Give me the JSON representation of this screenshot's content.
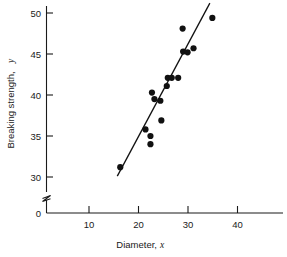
{
  "chart_data": {
    "type": "scatter",
    "title": "",
    "xlabel": "Diameter, x",
    "ylabel": "Breaking strength, y",
    "xlabel_main": "Diameter,",
    "xlabel_var": "x",
    "ylabel_main": "Breaking strength,",
    "ylabel_var": "y",
    "xlim": [
      0,
      46
    ],
    "ylim": [
      29,
      51
    ],
    "xticks": [
      10,
      20,
      30,
      40
    ],
    "xtick_labels": [
      "10",
      "20",
      "30",
      "40"
    ],
    "yticks": [
      30,
      35,
      40,
      45,
      50
    ],
    "ytick_labels": [
      "30",
      "35",
      "40",
      "45",
      "50"
    ],
    "y_origin_label": "0",
    "grid": false,
    "legend": null,
    "axis_break": {
      "axis": "y",
      "symbol": "zigzag",
      "between": [
        0,
        30
      ]
    },
    "points": [
      {
        "x": 14.9,
        "y": 31.2
      },
      {
        "x": 20.0,
        "y": 35.8
      },
      {
        "x": 21.0,
        "y": 35.0
      },
      {
        "x": 21.0,
        "y": 34.0
      },
      {
        "x": 21.3,
        "y": 40.3
      },
      {
        "x": 21.8,
        "y": 39.5
      },
      {
        "x": 23.0,
        "y": 39.3
      },
      {
        "x": 23.2,
        "y": 36.9
      },
      {
        "x": 24.3,
        "y": 41.1
      },
      {
        "x": 24.5,
        "y": 42.1
      },
      {
        "x": 25.3,
        "y": 42.1
      },
      {
        "x": 26.6,
        "y": 42.1
      },
      {
        "x": 27.5,
        "y": 48.1
      },
      {
        "x": 27.6,
        "y": 45.3
      },
      {
        "x": 28.5,
        "y": 45.2
      },
      {
        "x": 29.7,
        "y": 45.7
      },
      {
        "x": 33.5,
        "y": 49.4
      }
    ],
    "fit_line": {
      "type": "linear",
      "x_start": 14.3,
      "y_start": 30.1,
      "x_end": 33.0,
      "y_end": 51.2
    },
    "point_marker": "filled-circle",
    "point_color": "#111111",
    "line_color": "#111111"
  },
  "caption": ""
}
